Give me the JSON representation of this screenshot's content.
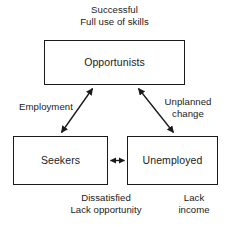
{
  "diagram": {
    "stroke_color": "#1a1a1a",
    "background_color": "#ffffff",
    "nodes": [
      {
        "id": "opportunists",
        "label": "Opportunists"
      },
      {
        "id": "seekers",
        "label": "Seekers"
      },
      {
        "id": "unemployed",
        "label": "Unemployed"
      }
    ],
    "captions": {
      "opportunists": {
        "line1": "Successful",
        "line2": "Full use of skills"
      },
      "seekers": {
        "line1": "Dissatisfied",
        "line2": "Lack opportunity"
      },
      "unemployed": {
        "line1": "Lack",
        "line2": "income"
      }
    },
    "edges": [
      {
        "id": "employment",
        "from": "seekers",
        "to": "opportunists",
        "label_line1": "Employment",
        "label_line2": "",
        "arrowheads": "both"
      },
      {
        "id": "unplanned-change",
        "from": "opportunists",
        "to": "unemployed",
        "label_line1": "Unplanned",
        "label_line2": "change",
        "arrowheads": "both"
      },
      {
        "id": "seekers-unemployed",
        "from": "seekers",
        "to": "unemployed",
        "label_line1": "",
        "label_line2": "",
        "arrowheads": "both"
      }
    ]
  }
}
